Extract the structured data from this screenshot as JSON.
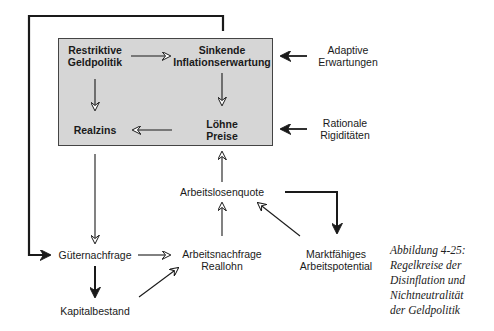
{
  "diagram": {
    "title": "Regelkreise der Disinflation und Nichtneutralität der Geldpolitik",
    "box_color": "#d6d6d6",
    "nodes": {
      "restriktive_geldpolitik": {
        "line1": "Restriktive",
        "line2": "Geldpolitik"
      },
      "sinkende_inflationserwartung": {
        "line1": "Sinkende",
        "line2": "Inflationserwartung"
      },
      "realzins": {
        "line1": "Realzins"
      },
      "loehne_preise": {
        "line1": "Löhne",
        "line2": "Preise"
      },
      "adaptive_erwartungen": {
        "line1": "Adaptive",
        "line2": "Erwartungen"
      },
      "rationale_rigiditaeten": {
        "line1": "Rationale",
        "line2": "Rigiditäten"
      },
      "arbeitslosenquote": {
        "line1": "Arbeitslosenquote"
      },
      "gueternachfrage": {
        "line1": "Güternachfrage"
      },
      "arbeitsnachfrage_reallohn": {
        "line1": "Arbeitsnachfrage",
        "line2": "Reallohn"
      },
      "kapitalbestand": {
        "line1": "Kapitalbestand"
      },
      "marktfaehiges_arbeitspotential": {
        "line1": "Marktfähiges",
        "line2": "Arbeitspotential"
      }
    },
    "edges": [
      {
        "from": "Restriktive Geldpolitik",
        "to": "Sinkende Inflationserwartung"
      },
      {
        "from": "Restriktive Geldpolitik",
        "to": "Realzins"
      },
      {
        "from": "Sinkende Inflationserwartung",
        "to": "Löhne Preise"
      },
      {
        "from": "Löhne Preise",
        "to": "Realzins"
      },
      {
        "from": "Adaptive Erwartungen",
        "to": "Sinkende Inflationserwartung"
      },
      {
        "from": "Rationale Rigiditäten",
        "to": "Löhne Preise"
      },
      {
        "from": "Realzins",
        "to": "Güternachfrage"
      },
      {
        "from": "Arbeitslosenquote",
        "to": "Löhne Preise"
      },
      {
        "from": "Arbeitsnachfrage Reallohn",
        "to": "Arbeitslosenquote"
      },
      {
        "from": "Marktfähiges Arbeitspotential",
        "to": "Arbeitslosenquote"
      },
      {
        "from": "Arbeitslosenquote",
        "to": "Marktfähiges Arbeitspotential",
        "style": "bold"
      },
      {
        "from": "Güternachfrage",
        "to": "Arbeitsnachfrage Reallohn"
      },
      {
        "from": "Güternachfrage",
        "to": "Kapitalbestand",
        "style": "bold"
      },
      {
        "from": "Kapitalbestand",
        "to": "Arbeitsnachfrage Reallohn"
      },
      {
        "from": "Box (Sinkende Inflationserwartung)",
        "to": "Güternachfrage",
        "style": "bold feedback loop"
      }
    ]
  },
  "caption": {
    "line1": "Abbildung 4-25:",
    "line2": "Regelkreise der",
    "line3": "Disinflation und",
    "line4": "Nichtneutralität",
    "line5": "der Geldpolitik"
  }
}
